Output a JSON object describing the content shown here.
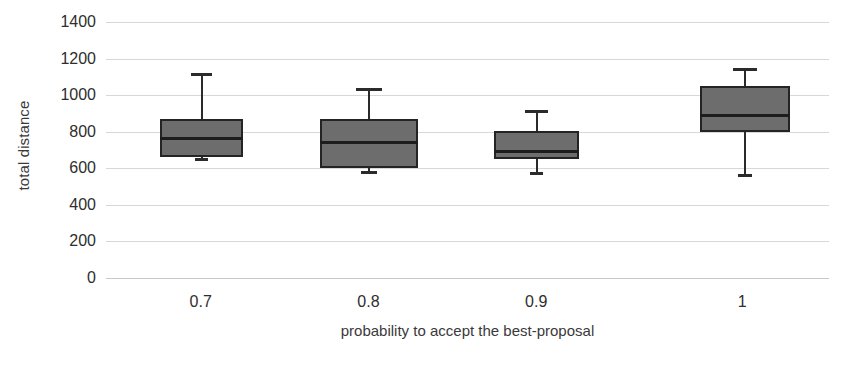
{
  "chart_data": {
    "type": "box",
    "title": "",
    "xlabel": "probability to accept the best-proposal",
    "ylabel": "total distance",
    "categories": [
      "0.7",
      "0.8",
      "0.9",
      "1"
    ],
    "ylim": [
      0,
      1400
    ],
    "yticks": [
      1400,
      1200,
      1000,
      800,
      600,
      400,
      200,
      0
    ],
    "ytick_labels": [
      "1400",
      "1200",
      "1000",
      "800",
      "600",
      "400",
      "200",
      "0"
    ],
    "grid": true,
    "legend": "none",
    "box_fill_color": "#6d6d6d",
    "box_edge_color": "#242424",
    "gridline_color": "#d8d8d8",
    "boxes": [
      {
        "category": "0.7",
        "whisker_high": 1120,
        "q3": 870,
        "median": 765,
        "q1": 660,
        "whisker_low": 655
      },
      {
        "category": "0.8",
        "whisker_high": 1040,
        "q3": 870,
        "median": 740,
        "q1": 600,
        "whisker_low": 585
      },
      {
        "category": "0.9",
        "whisker_high": 920,
        "q3": 805,
        "median": 690,
        "q1": 650,
        "whisker_low": 580
      },
      {
        "category": "1",
        "whisker_high": 1150,
        "q3": 1050,
        "median": 890,
        "q1": 800,
        "whisker_low": 570
      }
    ]
  }
}
